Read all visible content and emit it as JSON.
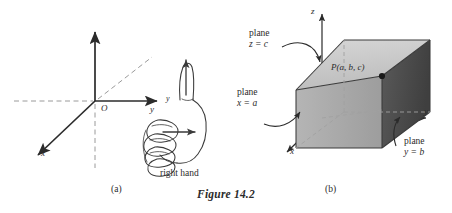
{
  "figure": {
    "caption": "Figure 14.2",
    "panels": [
      {
        "id": "a",
        "label": "(a)"
      },
      {
        "id": "b",
        "label": "(b)"
      }
    ]
  },
  "panel_a": {
    "name": "right-hand-rule-axes",
    "axes": [
      {
        "name": "z",
        "label": "z"
      },
      {
        "name": "y",
        "label": "y"
      },
      {
        "name": "x",
        "label": "x"
      }
    ],
    "origin_label": "O",
    "hand_caption": "right hand",
    "hand_axis_labels": {
      "thumb": "z",
      "fingers": "y",
      "palm": "x"
    }
  },
  "panel_b": {
    "name": "coordinate-planes-box",
    "axes": [
      {
        "name": "z",
        "label": "z"
      },
      {
        "name": "y",
        "label": "y"
      },
      {
        "name": "x",
        "label": "x"
      }
    ],
    "point": {
      "label": "P(a, b, c)",
      "dot": "point-marker"
    },
    "planes": [
      {
        "name": "plane-z-equals-c",
        "line1": "plane",
        "line2": "z = c"
      },
      {
        "name": "plane-x-equals-a",
        "line1": "plane",
        "line2": "x = a"
      },
      {
        "name": "plane-y-equals-b",
        "line1": "plane",
        "line2": "y = b"
      }
    ],
    "faces": {
      "top_face": "#c9c9c9",
      "front_face": "#a8a8a8",
      "right_face": "#4f4f4f"
    }
  },
  "colors": {
    "ink": "#2b2b2b",
    "dashed": "#9a9a9a",
    "background": "#ffffff"
  }
}
